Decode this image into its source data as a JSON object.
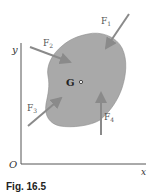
{
  "figure": {
    "caption": "Fig. 16.5",
    "axes": {
      "x_label": "x",
      "y_label": "y",
      "origin_label": "O"
    },
    "body": {
      "center_label": "G"
    },
    "forces": [
      {
        "id": "F1",
        "label": "F",
        "subscript": "1"
      },
      {
        "id": "F2",
        "label": "F",
        "subscript": "2"
      },
      {
        "id": "F3",
        "label": "F",
        "subscript": "3"
      },
      {
        "id": "F4",
        "label": "F",
        "subscript": "4"
      }
    ],
    "colors": {
      "body_fill": "#a9a9a9",
      "body_stroke": "#7a7a7a",
      "arrow": "#8a8a8a",
      "axis": "#555555"
    }
  }
}
